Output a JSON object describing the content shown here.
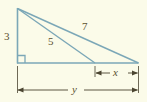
{
  "figure": {
    "background_color": "#fbfbe9",
    "line_color": "#7ba7b7",
    "dimension_color": "#4a4430",
    "label_color": "#5a5030",
    "labels": {
      "vertical_leg": "3",
      "cevian": "5",
      "hypotenuse": "7",
      "segment_right": "x",
      "base_total": "y"
    },
    "geometry": {
      "apex": [
        17,
        8
      ],
      "bottom_left": [
        17,
        63
      ],
      "bottom_right": [
        138,
        63
      ],
      "cevian_foot": [
        95,
        63
      ],
      "right_angle_marker": {
        "x": 17,
        "y": 55,
        "size": 8
      }
    },
    "dimensions": [
      {
        "name": "x",
        "label": "x",
        "from": 95,
        "to": 138,
        "y": 73
      },
      {
        "name": "y",
        "label": "y",
        "from": 17,
        "to": 138,
        "y": 90
      }
    ]
  }
}
